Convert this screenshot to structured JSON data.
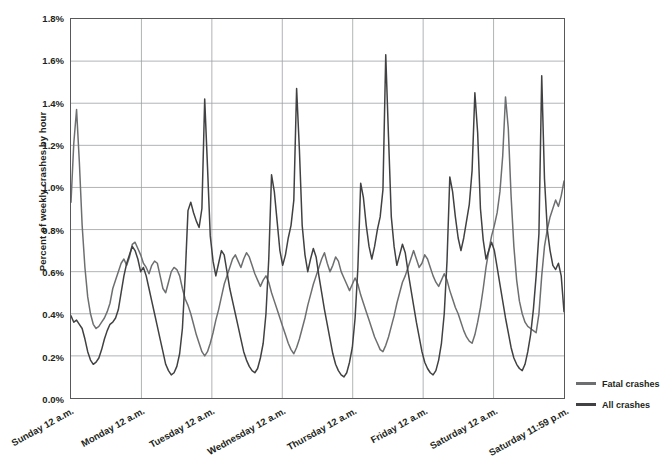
{
  "chart_data": {
    "type": "line",
    "title": "",
    "xlabel": "",
    "ylabel": "Percent of weekly crashes by hour",
    "ylim": [
      0,
      0.018
    ],
    "grid": true,
    "legend_position": "right",
    "ytick_labels": [
      "1.8%",
      "1.6%",
      "1.4%",
      "1.2%",
      "1.0%",
      "0.8%",
      "0.6%",
      "0.4%",
      "0.2%",
      "0.0%"
    ],
    "ytick_values": [
      0.018,
      0.016,
      0.014,
      0.012,
      0.01,
      0.008,
      0.006,
      0.004,
      0.002,
      0.0
    ],
    "xtick_labels": [
      "Sunday 12 a.m.",
      "Monday 12 a.m.",
      "Tuesday 12 a.m.",
      "Wednesday 12 a.m.",
      "Thursday 12 a.m.",
      "Friday 12 a.m.",
      "Saturday 12 a.m.",
      "Saturday 11:59 p.m."
    ],
    "xtick_hours": [
      0,
      24,
      48,
      72,
      96,
      120,
      144,
      168
    ],
    "x_unit": "hour of week",
    "x_range": [
      0,
      168
    ],
    "colors": {
      "fatal": "#6d6e70",
      "all": "#414042",
      "grid": "#9d9fa2",
      "frame": "#58585a"
    },
    "series": [
      {
        "name": "Fatal crashes",
        "color": "#6d6e70",
        "values": [
          0.0093,
          0.0121,
          0.0137,
          0.0112,
          0.0082,
          0.0062,
          0.0048,
          0.004,
          0.0035,
          0.0033,
          0.0034,
          0.0036,
          0.0038,
          0.0041,
          0.0045,
          0.0052,
          0.0056,
          0.006,
          0.0064,
          0.0066,
          0.0063,
          0.0067,
          0.0073,
          0.0074,
          0.0071,
          0.0068,
          0.0064,
          0.0062,
          0.0059,
          0.0063,
          0.0065,
          0.0064,
          0.0058,
          0.0052,
          0.005,
          0.0055,
          0.006,
          0.0062,
          0.0061,
          0.0058,
          0.0052,
          0.0047,
          0.0044,
          0.004,
          0.0035,
          0.003,
          0.0026,
          0.0022,
          0.002,
          0.0022,
          0.0026,
          0.0031,
          0.0037,
          0.0042,
          0.0048,
          0.0054,
          0.0058,
          0.0062,
          0.0066,
          0.0068,
          0.0065,
          0.0062,
          0.0066,
          0.0069,
          0.0067,
          0.0063,
          0.0059,
          0.0056,
          0.0053,
          0.0056,
          0.0058,
          0.0055,
          0.005,
          0.0046,
          0.0042,
          0.0038,
          0.0034,
          0.003,
          0.0026,
          0.0023,
          0.0021,
          0.0024,
          0.0028,
          0.0033,
          0.0038,
          0.0044,
          0.0049,
          0.0054,
          0.0058,
          0.0062,
          0.0066,
          0.0069,
          0.0064,
          0.006,
          0.0063,
          0.0067,
          0.0065,
          0.006,
          0.0057,
          0.0054,
          0.0051,
          0.0054,
          0.0057,
          0.0054,
          0.0049,
          0.0045,
          0.0041,
          0.0037,
          0.0033,
          0.0029,
          0.0026,
          0.0023,
          0.0022,
          0.0025,
          0.0029,
          0.0034,
          0.0039,
          0.0045,
          0.005,
          0.0055,
          0.0058,
          0.0062,
          0.0066,
          0.007,
          0.0066,
          0.0062,
          0.0064,
          0.0068,
          0.0066,
          0.0062,
          0.0058,
          0.0055,
          0.0053,
          0.0056,
          0.0059,
          0.0056,
          0.0051,
          0.0047,
          0.0043,
          0.004,
          0.0036,
          0.0032,
          0.0029,
          0.0027,
          0.0026,
          0.003,
          0.0036,
          0.0043,
          0.0052,
          0.0062,
          0.007,
          0.0077,
          0.0082,
          0.0088,
          0.0098,
          0.0115,
          0.0143,
          0.0128,
          0.0096,
          0.0072,
          0.0056,
          0.0046,
          0.004,
          0.0036,
          0.0034,
          0.0033,
          0.0032,
          0.0031,
          0.004,
          0.0058,
          0.0072,
          0.008,
          0.0086,
          0.009,
          0.0094,
          0.0091,
          0.0096,
          0.0103
        ]
      },
      {
        "name": "All crashes",
        "color": "#414042",
        "values": [
          0.0039,
          0.0036,
          0.0037,
          0.0035,
          0.0033,
          0.0028,
          0.0022,
          0.0018,
          0.0016,
          0.0017,
          0.0019,
          0.0023,
          0.0028,
          0.0032,
          0.0035,
          0.0036,
          0.0038,
          0.0042,
          0.005,
          0.0058,
          0.0064,
          0.0068,
          0.0072,
          0.007,
          0.0066,
          0.006,
          0.0062,
          0.0058,
          0.0052,
          0.0046,
          0.004,
          0.0034,
          0.0028,
          0.0022,
          0.0016,
          0.0013,
          0.0011,
          0.0012,
          0.0015,
          0.0021,
          0.0033,
          0.0058,
          0.0089,
          0.0093,
          0.0088,
          0.0084,
          0.0081,
          0.009,
          0.0142,
          0.011,
          0.0077,
          0.0065,
          0.0058,
          0.0064,
          0.007,
          0.0068,
          0.006,
          0.0052,
          0.0046,
          0.004,
          0.0034,
          0.0028,
          0.0022,
          0.0018,
          0.0015,
          0.0013,
          0.0012,
          0.0014,
          0.0019,
          0.0026,
          0.004,
          0.0066,
          0.0106,
          0.0098,
          0.0084,
          0.007,
          0.0063,
          0.0068,
          0.0076,
          0.0082,
          0.0094,
          0.0147,
          0.0118,
          0.0082,
          0.0068,
          0.006,
          0.0066,
          0.0071,
          0.0067,
          0.0058,
          0.005,
          0.0042,
          0.0035,
          0.0028,
          0.0021,
          0.0016,
          0.0013,
          0.0011,
          0.001,
          0.0012,
          0.0017,
          0.0024,
          0.0038,
          0.0062,
          0.0102,
          0.0095,
          0.0082,
          0.0072,
          0.0066,
          0.0072,
          0.008,
          0.0086,
          0.0099,
          0.0163,
          0.0124,
          0.0086,
          0.0072,
          0.0063,
          0.0068,
          0.0073,
          0.0069,
          0.006,
          0.0052,
          0.0044,
          0.0036,
          0.0029,
          0.0022,
          0.0017,
          0.0014,
          0.0012,
          0.0011,
          0.0013,
          0.0018,
          0.0026,
          0.004,
          0.0065,
          0.0105,
          0.0098,
          0.0086,
          0.0076,
          0.007,
          0.0076,
          0.0084,
          0.0092,
          0.0108,
          0.0145,
          0.0126,
          0.009,
          0.0075,
          0.0066,
          0.007,
          0.0074,
          0.007,
          0.0062,
          0.0054,
          0.0046,
          0.0038,
          0.0031,
          0.0024,
          0.0019,
          0.0016,
          0.0014,
          0.0013,
          0.0016,
          0.0022,
          0.003,
          0.0042,
          0.0058,
          0.0078,
          0.0153,
          0.0104,
          0.008,
          0.007,
          0.0063,
          0.0061,
          0.0064,
          0.0058,
          0.0041
        ]
      }
    ]
  },
  "legend": {
    "items": [
      {
        "label": "Fatal crashes",
        "color": "#6d6e70"
      },
      {
        "label": "All crashes",
        "color": "#414042"
      }
    ]
  }
}
